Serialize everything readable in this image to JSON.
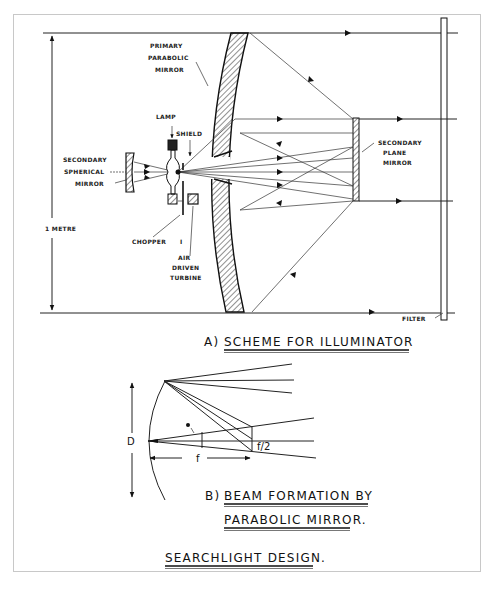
{
  "figure": {
    "title": "SEARCHLIGHT DESIGN.",
    "part_a": {
      "caption_prefix": "A)",
      "caption": "SCHEME FOR ILLUMINATOR",
      "labels": {
        "primary_mirror_1": "PRIMARY",
        "primary_mirror_2": "PARABOLIC",
        "primary_mirror_3": "MIRROR",
        "lamp": "LAMP",
        "shield": "SHIELD",
        "secondary_spherical_1": "SECONDARY",
        "secondary_spherical_2": "SPHERICAL",
        "secondary_spherical_3": "MIRROR",
        "secondary_plane_1": "SECONDARY",
        "secondary_plane_2": "PLANE",
        "secondary_plane_3": "MIRROR",
        "chopper": "CHOPPER",
        "chopper_num": "I",
        "turbine_1": "AIR",
        "turbine_2": "DRIVEN",
        "turbine_3": "TURBINE",
        "dimension": "1 METRE",
        "filter": "FILTER"
      }
    },
    "part_b": {
      "caption_prefix": "B)",
      "caption_line1": "BEAM FORMATION BY",
      "caption_line2": "PARABOLIC MIRROR.",
      "symbols": {
        "diameter": "D",
        "focal_length": "f",
        "angle": "θ",
        "ratio": "f/2"
      }
    }
  },
  "colors": {
    "ink": "#222222",
    "paper": "#ffffff",
    "frame": "#c8c8c8"
  }
}
